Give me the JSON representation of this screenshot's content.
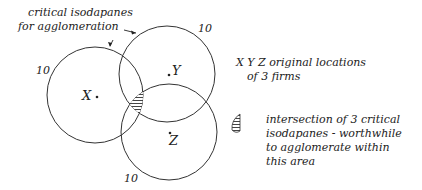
{
  "title_annotation": {
    "line1": "critical isodapanes",
    "line2": "for agglomeration"
  },
  "firms": [
    {
      "id": "X",
      "label": "X",
      "isodapane_value": "10"
    },
    {
      "id": "Y",
      "label": "Y",
      "isodapane_value": "10"
    },
    {
      "id": "Z",
      "label": "Z",
      "isodapane_value": "10"
    }
  ],
  "legend": {
    "firms_line1": "X Y Z  original locations",
    "firms_line2": "of 3 firms",
    "area_line1": "intersection of 3 critical",
    "area_line2": "isodapanes - worthwhile",
    "area_line3": "to agglomerate within",
    "area_line4": "this area"
  },
  "colors": {
    "ink": "#222222",
    "hatch": "#555555",
    "background": "#ffffff"
  }
}
